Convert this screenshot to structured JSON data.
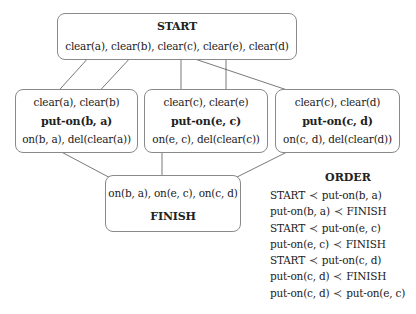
{
  "diagram": {
    "start": {
      "title": "START",
      "effects": "clear(a), clear(b), clear(c), clear(e), clear(d)"
    },
    "actions": [
      {
        "preconditions": "clear(a), clear(b)",
        "name": "put-on(b, a)",
        "effects": "on(b, a), del(clear(a))"
      },
      {
        "preconditions": "clear(c), clear(e)",
        "name": "put-on(e, c)",
        "effects": "on(e, c), del(clear(c))"
      },
      {
        "preconditions": "clear(c), clear(d)",
        "name": "put-on(c, d)",
        "effects": "on(c, d), del(clear(d))"
      }
    ],
    "finish": {
      "preconditions": "on(b, a), on(e, c), on(c, d)",
      "title": "FINISH"
    },
    "order": {
      "title": "ORDER",
      "symbol": "≺",
      "constraints": [
        {
          "before": "START",
          "after": "put-on(b, a)"
        },
        {
          "before": "put-on(b, a)",
          "after": "FINISH"
        },
        {
          "before": "START",
          "after": "put-on(e, c)"
        },
        {
          "before": "put-on(e, c)",
          "after": "FINISH"
        },
        {
          "before": "START",
          "after": "put-on(c, d)"
        },
        {
          "before": "put-on(c, d)",
          "after": "FINISH"
        },
        {
          "before": "put-on(c, d)",
          "after": "put-on(e, c)"
        }
      ]
    },
    "caption": "",
    "colors": {
      "box_border": "#8a8a8a",
      "edge": "#444444",
      "text": "#222222"
    }
  }
}
